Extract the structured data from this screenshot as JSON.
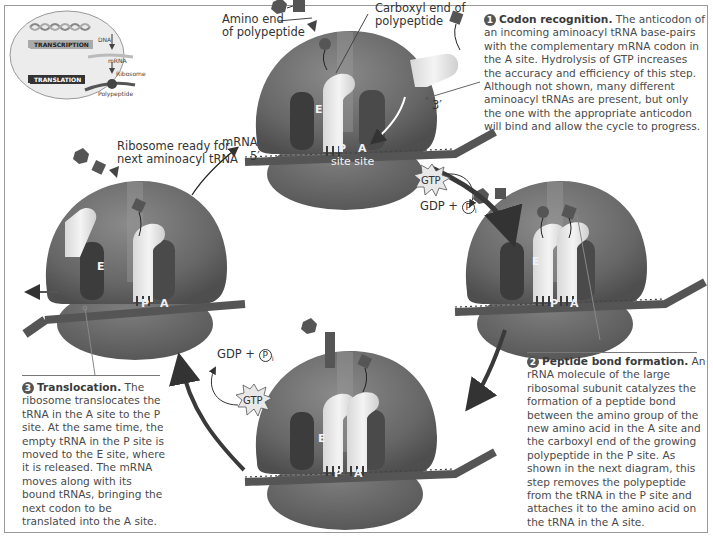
{
  "figure": {
    "colors": {
      "ribosome": "#6e6e6e",
      "ribosome_dark": "#5a5a5a",
      "trna": "#e6e6e6",
      "mrna": "#555555",
      "arrow": "#444444",
      "text": "#4a4a4a",
      "border": "#9a9a9a"
    }
  },
  "inset": {
    "dna_label": "DNA",
    "transcription_label": "TRANSCRIPTION",
    "mrna_label": "mRNA",
    "ribosome_label": "Ribosome",
    "translation_label": "TRANSLATION",
    "polypeptide_label": "Polypeptide"
  },
  "top_ribosome": {
    "amino_end_label_line1": "Amino end",
    "amino_end_label_line2": "of polypeptide",
    "carboxyl_end_label_line1": "Carboxyl end of",
    "carboxyl_end_label_line2": "polypeptide",
    "mrna_label": "mRNA",
    "five_prime": "5′",
    "three_prime": "3′",
    "e_site": "E",
    "p_site": "P",
    "a_site": "A",
    "site_word": "site site"
  },
  "left_ribosome": {
    "ready_label_line1": "Ribosome ready for",
    "ready_label_line2": "next aminoacyl tRNA",
    "e_site": "E",
    "p_site": "P",
    "a_site": "A"
  },
  "right_ribosome": {
    "e_site": "E",
    "p_site": "P",
    "a_site": "A"
  },
  "bottom_ribosome": {
    "e_site": "E",
    "p_site": "P",
    "a_site": "A"
  },
  "energy": {
    "top_gtp": "GTP",
    "top_products": "GDP + ",
    "bottom_gtp": "GTP",
    "bottom_products": "GDP + ",
    "phosphate": "P",
    "phosphate_sub": "i"
  },
  "steps": [
    {
      "number": "1",
      "title": "Codon recognition.",
      "body": "The anticodon of an incoming aminoacyl tRNA base-pairs with the complementary mRNA codon in the A site. Hydrolysis of GTP increases the accuracy and efficiency of this step. Although not shown, many different aminoacyl tRNAs are present, but only the one with the appropriate anticodon will bind and allow the cycle to progress."
    },
    {
      "number": "2",
      "title": "Peptide bond formation.",
      "body": "An rRNA molecule of the large ribosomal subunit catalyzes the formation of a peptide bond between the amino group of the new amino acid in the A site and the carboxyl end of the growing polypeptide in the P site. As shown in the next diagram, this step removes the polypeptide from the tRNA in the P site and attaches it to the amino acid on the tRNA in the A site."
    },
    {
      "number": "3",
      "title": "Translocation.",
      "body": "The ribosome translocates the tRNA in the A site to the P site. At the same time, the empty tRNA in the P site is moved to the E site, where it is released. The mRNA moves along with its bound tRNAs, bringing the next codon to be translated into the A site."
    }
  ]
}
